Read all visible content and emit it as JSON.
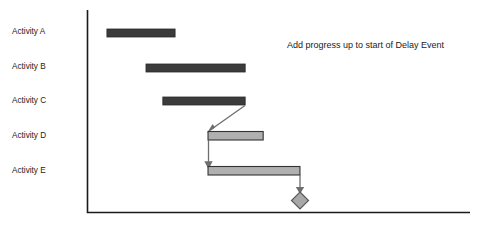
{
  "chart_data": {
    "type": "bar",
    "title": "",
    "subtitle": "",
    "xlabel": "",
    "ylabel": "",
    "grid": false,
    "legend_position": "none",
    "orientation": "horizontal",
    "chart_kind": "gantt",
    "axis": {
      "x_start_px": 87,
      "x_end_px": 470,
      "y_top_px": 10,
      "y_bottom_px": 213,
      "tick_labels": [],
      "x_range_units": [
        0,
        100
      ]
    },
    "categories": [
      "Activity A",
      "Activity B",
      "Activity C",
      "Activity D",
      "Activity E"
    ],
    "bars": [
      {
        "label": "Activity A",
        "start": 5.2,
        "end": 23.0,
        "duration": 17.8,
        "row": 0,
        "style": "solid-progress",
        "fill": "#3b3b3b",
        "stroke": "#2a2a2a"
      },
      {
        "label": "Activity B",
        "start": 15.4,
        "end": 41.3,
        "duration": 25.9,
        "row": 1,
        "style": "solid-progress",
        "fill": "#3b3b3b",
        "stroke": "#2a2a2a"
      },
      {
        "label": "Activity C",
        "start": 19.8,
        "end": 41.3,
        "duration": 21.5,
        "row": 2,
        "style": "solid-progress",
        "fill": "#3b3b3b",
        "stroke": "#2a2a2a"
      },
      {
        "label": "Activity D",
        "start": 31.6,
        "end": 46.0,
        "duration": 14.4,
        "row": 3,
        "style": "open-remaining",
        "fill": "#b0b0b0",
        "stroke": "#333333"
      },
      {
        "label": "Activity E",
        "start": 31.6,
        "end": 55.6,
        "duration": 24.0,
        "row": 4,
        "style": "open-remaining",
        "fill": "#b0b0b0",
        "stroke": "#333333"
      }
    ],
    "milestone": {
      "name": "delay-event-milestone",
      "at": 55.6,
      "row": 5,
      "shape": "diamond",
      "fill": "#a8a8a8",
      "stroke": "#5a5a5a"
    },
    "links": [
      {
        "from": "Activity C",
        "to": "Activity D",
        "type": "finish-to-start"
      },
      {
        "from": "Activity D",
        "to": "Activity E",
        "type": "start-to-start"
      },
      {
        "from": "Activity E",
        "to": "delay-event-milestone",
        "type": "finish-to-start"
      }
    ],
    "annotations": [
      {
        "text": "Add progress up to start of Delay Event",
        "x": 287,
        "y": 46
      }
    ],
    "colors": {
      "axis": "#1a1a1a",
      "progress_bar": "#3b3b3b",
      "remaining_bar": "#b0b0b0",
      "link": "#6e6e6e",
      "milestone": "#a8a8a8",
      "text": "#1c1c1c",
      "background": "#ffffff"
    }
  },
  "labels": {
    "row_0": "Activity A",
    "row_1": "Activity B",
    "row_2": "Activity C",
    "row_3": "Activity D",
    "row_4": "Activity E"
  },
  "annotation": {
    "note": "Add progress up to start of Delay Event"
  }
}
